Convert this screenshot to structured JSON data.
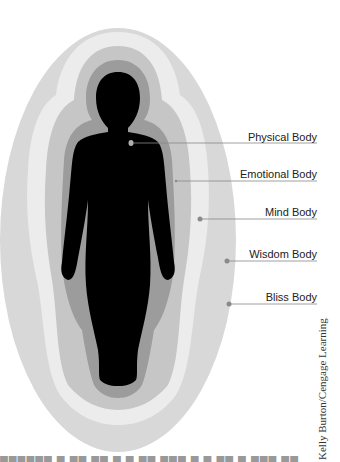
{
  "figure": {
    "labels": [
      {
        "name": "physical",
        "text": "Physical Body",
        "y": 137
      },
      {
        "name": "emotional",
        "text": "Emotional Body",
        "y": 174
      },
      {
        "name": "mind",
        "text": "Mind Body",
        "y": 212
      },
      {
        "name": "wisdom",
        "text": "Wisdom Body",
        "y": 254
      },
      {
        "name": "bliss",
        "text": "Bliss Body",
        "y": 297
      }
    ],
    "credit": "Kelly Burton/Cengage Learning",
    "colors": {
      "bliss": "#d8d8d8",
      "wisdom": "#ececec",
      "mind": "#c6c6c6",
      "emotional": "#9c9c9c",
      "physical": "#000000",
      "leader": "#888888",
      "dot": "#8a8a8a"
    }
  }
}
